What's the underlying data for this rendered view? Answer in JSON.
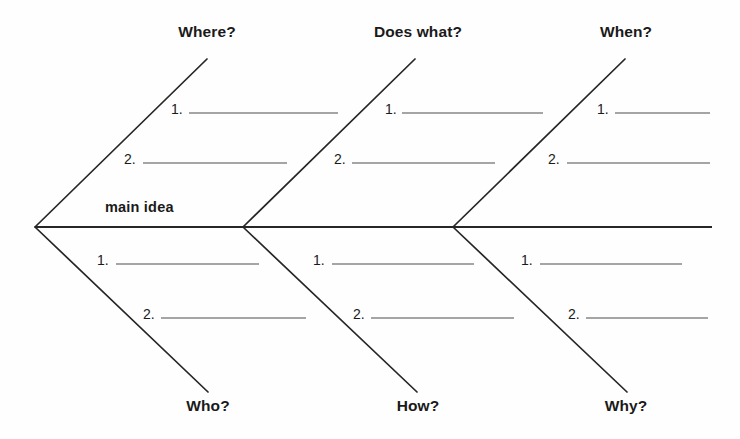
{
  "diagram": {
    "type": "fishbone-ishikawa-worksheet",
    "center_label": "main idea",
    "spine": {
      "x1": 35,
      "y1": 227,
      "x2": 712,
      "y2": 227
    },
    "categories": [
      {
        "id": "where",
        "label": "Where?",
        "position": "top",
        "label_x": 207,
        "label_y": 24,
        "bone": {
          "x1": 35,
          "y1": 227,
          "x2": 207,
          "y2": 59
        },
        "items": [
          {
            "number": "1.",
            "num_x": 171,
            "num_y": 102,
            "rule_x1": 189,
            "rule_x2": 338,
            "rule_y": 113
          },
          {
            "number": "2.",
            "num_x": 124,
            "num_y": 152,
            "rule_x1": 143,
            "rule_x2": 287,
            "rule_y": 163
          }
        ]
      },
      {
        "id": "does-what",
        "label": "Does what?",
        "position": "top",
        "label_x": 418,
        "label_y": 24,
        "bone": {
          "x1": 243,
          "y1": 227,
          "x2": 415,
          "y2": 59
        },
        "items": [
          {
            "number": "1.",
            "num_x": 385,
            "num_y": 102,
            "rule_x1": 402,
            "rule_x2": 543,
            "rule_y": 113
          },
          {
            "number": "2.",
            "num_x": 334,
            "num_y": 152,
            "rule_x1": 352,
            "rule_x2": 495,
            "rule_y": 163
          }
        ]
      },
      {
        "id": "when",
        "label": "When?",
        "position": "top",
        "label_x": 626,
        "label_y": 24,
        "bone": {
          "x1": 453,
          "y1": 227,
          "x2": 625,
          "y2": 59
        },
        "items": [
          {
            "number": "1.",
            "num_x": 597,
            "num_y": 102,
            "rule_x1": 615,
            "rule_x2": 710,
            "rule_y": 113
          },
          {
            "number": "2.",
            "num_x": 548,
            "num_y": 152,
            "rule_x1": 567,
            "rule_x2": 710,
            "rule_y": 163
          }
        ]
      },
      {
        "id": "who",
        "label": "Who?",
        "position": "bottom",
        "label_x": 208,
        "label_y": 398,
        "bone": {
          "x1": 35,
          "y1": 227,
          "x2": 208,
          "y2": 392
        },
        "items": [
          {
            "number": "1.",
            "num_x": 97,
            "num_y": 253,
            "rule_x1": 116,
            "rule_x2": 259,
            "rule_y": 264
          },
          {
            "number": "2.",
            "num_x": 143,
            "num_y": 307,
            "rule_x1": 161,
            "rule_x2": 306,
            "rule_y": 318
          }
        ]
      },
      {
        "id": "how",
        "label": "How?",
        "position": "bottom",
        "label_x": 418,
        "label_y": 398,
        "bone": {
          "x1": 243,
          "y1": 227,
          "x2": 417,
          "y2": 392
        },
        "items": [
          {
            "number": "1.",
            "num_x": 313,
            "num_y": 253,
            "rule_x1": 332,
            "rule_x2": 474,
            "rule_y": 264
          },
          {
            "number": "2.",
            "num_x": 353,
            "num_y": 307,
            "rule_x1": 371,
            "rule_x2": 514,
            "rule_y": 318
          }
        ]
      },
      {
        "id": "why",
        "label": "Why?",
        "position": "bottom",
        "label_x": 626,
        "label_y": 398,
        "bone": {
          "x1": 453,
          "y1": 227,
          "x2": 627,
          "y2": 392
        },
        "items": [
          {
            "number": "1.",
            "num_x": 521,
            "num_y": 253,
            "rule_x1": 540,
            "rule_x2": 682,
            "rule_y": 264
          },
          {
            "number": "2.",
            "num_x": 568,
            "num_y": 307,
            "rule_x1": 586,
            "rule_x2": 708,
            "rule_y": 318
          }
        ]
      }
    ],
    "colors": {
      "background": "#fefefe",
      "bone_stroke": "#262626",
      "rule_stroke": "#4d4d4d",
      "text": "#1a1a1a"
    }
  }
}
